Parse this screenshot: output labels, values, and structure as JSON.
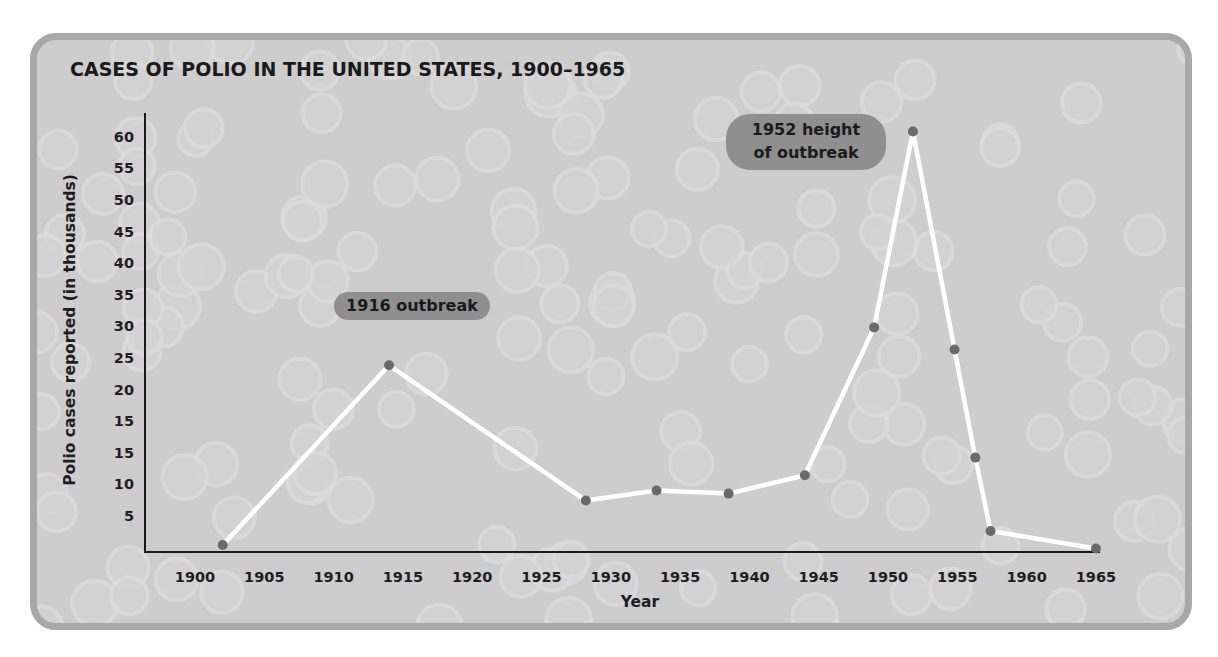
{
  "chart_data": {
    "type": "line",
    "title": "CASES OF POLIO IN THE UNITED STATES, 1900–1965",
    "xlabel": "Year",
    "ylabel": "Polio cases reported (in thousands)",
    "x_tick_labels": [
      "1900",
      "1905",
      "1910",
      "1915",
      "1920",
      "1925",
      "1930",
      "1935",
      "1940",
      "1945",
      "1950",
      "1955",
      "1960",
      "1965"
    ],
    "y_tick_labels": [
      "5",
      "10",
      "15",
      "15",
      "20",
      "25",
      "30",
      "35",
      "40",
      "45",
      "50",
      "55",
      "60"
    ],
    "xlim": [
      1900,
      1965
    ],
    "grid": false,
    "legend": "none",
    "series": [
      {
        "name": "Polio cases reported (thousands)",
        "x": [
          1902,
          1914,
          1928.2,
          1933.3,
          1938.5,
          1944,
          1949,
          1951.8,
          1954.8,
          1956.3,
          1957.4,
          1965
        ],
        "y": [
          1,
          24,
          7.6,
          9.2,
          8.7,
          11.6,
          30,
          61,
          26.5,
          14.4,
          3,
          0.5
        ],
        "line_color": "#ffffff",
        "marker_color": "#6a6a6a"
      }
    ],
    "annotations": [
      {
        "id": "outbreak-1916",
        "lines": [
          "1916 outbreak"
        ]
      },
      {
        "id": "peak-1952",
        "lines": [
          "1952 height",
          "of outbreak"
        ]
      }
    ]
  },
  "colors": {
    "panel_bg": "#cdcdcd",
    "frame_border": "#a8a8a8",
    "annotation_bg": "#8f8f8f",
    "axis": "#1a1a1a"
  }
}
